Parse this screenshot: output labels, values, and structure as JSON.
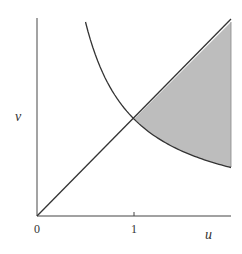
{
  "chart_data": {
    "type": "line",
    "title": "",
    "xlabel": "u",
    "ylabel": "v",
    "xlim": [
      0,
      2
    ],
    "ylim": [
      0,
      2.04
    ],
    "x_ticks": [
      "0",
      "1"
    ],
    "grid": false,
    "legend": null,
    "series": [
      {
        "name": "v = u",
        "x": [
          0,
          1,
          2
        ],
        "y": [
          0,
          1,
          2
        ]
      },
      {
        "name": "v = 1/u",
        "x": [
          0.5,
          0.75,
          1,
          1.25,
          1.5,
          1.75,
          2
        ],
        "y": [
          2.0,
          1.333,
          1,
          0.8,
          0.667,
          0.571,
          0.5
        ]
      }
    ],
    "shaded_region": {
      "description": "Region between v = u (upper) and v = 1/u (lower) for 1 <= u <= 2",
      "u_range": [
        1,
        2
      ],
      "upper": "v = u",
      "lower": "v = 1/u",
      "color": "#bdbdbd"
    },
    "annotations": []
  },
  "labels": {
    "x_axis": "u",
    "y_axis": "v",
    "tick_0": "0",
    "tick_1": "1"
  },
  "colors": {
    "axis": "#555555",
    "curve": "#333333",
    "shade": "#bdbdbd"
  }
}
